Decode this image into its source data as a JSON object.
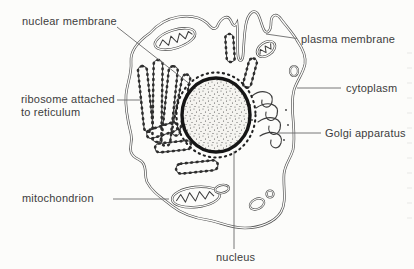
{
  "diagram": {
    "labels": {
      "nuclear_membrane": "nuclear membrane",
      "plasma_membrane": "plasma membrane",
      "ribosome_line1": "ribosome attached",
      "ribosome_line2": "to reticulum",
      "cytoplasm": "cytoplasm",
      "golgi_apparatus": "Golgi apparatus",
      "mitochondrion": "mitochondrion",
      "nucleus": "nucleus"
    },
    "colors": {
      "background": "#fcfcfa",
      "line": "#4a4a4a",
      "text": "#3d3d3d",
      "nucleus_ring": "#161616"
    }
  }
}
